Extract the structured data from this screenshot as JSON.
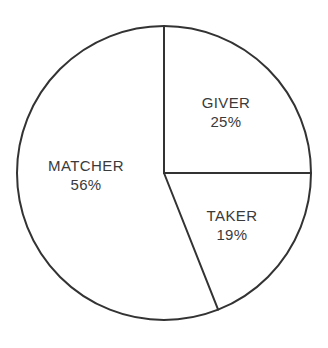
{
  "chart_data": {
    "type": "pie",
    "title": "",
    "subtitle": "",
    "xlabel": "",
    "ylabel": "",
    "legend": "none",
    "grid": false,
    "units": "percent",
    "total": 100,
    "categories": [
      "GIVER",
      "TAKER",
      "MATCHER"
    ],
    "values": [
      25,
      19,
      56
    ],
    "slices": [
      {
        "name": "GIVER",
        "value": 25,
        "value_label": "25%",
        "start_angle_deg": 0,
        "end_angle_deg": 90,
        "label_x": 226,
        "label_y": 103,
        "color": "#ffffff",
        "stroke": "#333333"
      },
      {
        "name": "TAKER",
        "value": 19,
        "value_label": "19%",
        "start_angle_deg": 90,
        "end_angle_deg": 158.4,
        "label_x": 232,
        "label_y": 216,
        "color": "#ffffff",
        "stroke": "#333333"
      },
      {
        "name": "MATCHER",
        "value": 56,
        "value_label": "56%",
        "start_angle_deg": 158.4,
        "end_angle_deg": 360,
        "label_x": 86,
        "label_y": 166,
        "color": "#ffffff",
        "stroke": "#333333"
      }
    ],
    "geometry": {
      "center_x": 164,
      "center_y": 173,
      "radius": 147,
      "stroke_width": 2
    },
    "colors": {
      "background": "#ffffff",
      "stroke": "#333333",
      "text": "#3a3a3a"
    }
  }
}
